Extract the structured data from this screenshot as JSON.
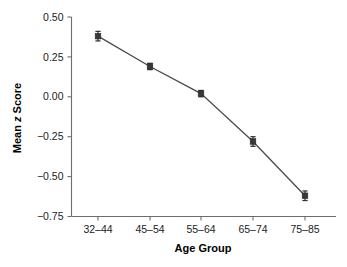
{
  "chart_data": {
    "type": "line",
    "title": "",
    "subtitle": "",
    "xlabel": "Age Group",
    "ylabel_parts": {
      "prefix": "Mean ",
      "italic": "z",
      "suffix": " Score"
    },
    "ylabel": "Mean z Score",
    "categories": [
      "32–44",
      "45–54",
      "55–64",
      "65–74",
      "75–85"
    ],
    "values": [
      0.38,
      0.19,
      0.02,
      -0.28,
      -0.62
    ],
    "errors": [
      0.03,
      0.02,
      0.02,
      0.03,
      0.03
    ],
    "series": [
      {
        "name": "Mean z Score",
        "values": [
          0.38,
          0.19,
          0.02,
          -0.28,
          -0.62
        ],
        "errors": [
          0.03,
          0.02,
          0.02,
          0.03,
          0.03
        ]
      }
    ],
    "ylim": [
      -0.75,
      0.5
    ],
    "yticks": [
      0.5,
      0.25,
      0.0,
      -0.25,
      -0.5,
      -0.75
    ],
    "ytick_labels": [
      "0.50",
      "0.25",
      "0.00",
      "−0.25",
      "−0.50",
      "−0.75"
    ],
    "xtick_labels": [
      "32–44",
      "45–54",
      "55–64",
      "65–74",
      "75–85"
    ],
    "grid": false,
    "legend": false,
    "legend_position": "none",
    "marker": "square",
    "colors": {
      "line": "#4a4a4a",
      "marker": "#383838",
      "error_bar": "#2e2e2e",
      "axis": "#6e6e6e",
      "text": "#1c1c1c",
      "background": "#ffffff"
    }
  }
}
